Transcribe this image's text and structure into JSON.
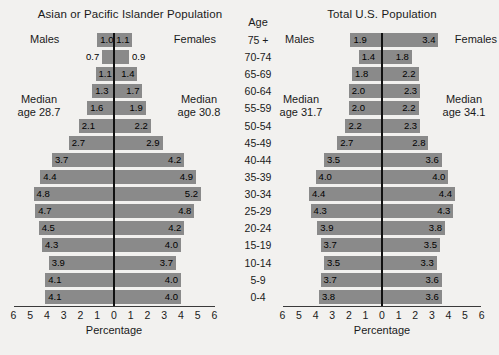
{
  "age_column": {
    "header": "Age",
    "groups": [
      "75 +",
      "70-74",
      "65-69",
      "60-64",
      "55-59",
      "50-54",
      "45-49",
      "40-44",
      "35-39",
      "30-34",
      "25-29",
      "20-24",
      "15-19",
      "10-14",
      "5-9",
      "0-4"
    ]
  },
  "axis": {
    "caption": "Percentage",
    "ticks": [
      "6",
      "5",
      "4",
      "3",
      "2",
      "1",
      "0",
      "1",
      "2",
      "3",
      "4",
      "5",
      "6"
    ],
    "max": 6
  },
  "panels": [
    {
      "id": "left",
      "title": "Asian or Pacific Islander Population",
      "males_label": "Males",
      "females_label": "Females",
      "median_male": "Median\nage 28.7",
      "median_male_line1": "Median",
      "median_male_line2": "age 28.7",
      "median_female_line1": "Median",
      "median_female_line2": "age 30.8"
    },
    {
      "id": "right",
      "title": "Total U.S. Population",
      "males_label": "Males",
      "females_label": "Females",
      "median_male_line1": "Median",
      "median_male_line2": "age 31.7",
      "median_female_line1": "Median",
      "median_female_line2": "age 34.1"
    }
  ],
  "colors": {
    "bar": "#8a8a8a",
    "background": "#f2f1ef",
    "axis": "#3a3a3a",
    "text": "#1a1a1a"
  },
  "chart_data": [
    {
      "type": "bar",
      "title": "Asian or Pacific Islander Population",
      "subtype": "population-pyramid",
      "xlabel": "Percentage",
      "ylabel": "Age",
      "xlim": [
        -6,
        6
      ],
      "xticks": [
        6,
        5,
        4,
        3,
        2,
        1,
        0,
        1,
        2,
        3,
        4,
        5,
        6
      ],
      "grid": false,
      "legend": [
        "Males",
        "Females"
      ],
      "annotations": [
        "Median age 28.7",
        "Median age 30.8"
      ],
      "categories": [
        "75 +",
        "70-74",
        "65-69",
        "60-64",
        "55-59",
        "50-54",
        "45-49",
        "40-44",
        "35-39",
        "30-34",
        "25-29",
        "20-24",
        "15-19",
        "10-14",
        "5-9",
        "0-4"
      ],
      "series": [
        {
          "name": "Males",
          "values": [
            1.0,
            0.7,
            1.1,
            1.3,
            1.6,
            2.1,
            2.7,
            3.7,
            4.4,
            4.8,
            4.7,
            4.5,
            4.3,
            3.9,
            4.1,
            4.1
          ]
        },
        {
          "name": "Females",
          "values": [
            1.1,
            0.9,
            1.4,
            1.7,
            1.9,
            2.2,
            2.9,
            4.2,
            4.9,
            5.2,
            4.8,
            4.2,
            4.0,
            3.7,
            4.0,
            4.0
          ]
        }
      ],
      "label_outside_rows": [
        1
      ]
    },
    {
      "type": "bar",
      "title": "Total U.S. Population",
      "subtype": "population-pyramid",
      "xlabel": "Percentage",
      "ylabel": "Age",
      "xlim": [
        -6,
        6
      ],
      "xticks": [
        6,
        5,
        4,
        3,
        2,
        1,
        0,
        1,
        2,
        3,
        4,
        5,
        6
      ],
      "grid": false,
      "legend": [
        "Males",
        "Females"
      ],
      "annotations": [
        "Median age 31.7",
        "Median age 34.1"
      ],
      "categories": [
        "75 +",
        "70-74",
        "65-69",
        "60-64",
        "55-59",
        "50-54",
        "45-49",
        "40-44",
        "35-39",
        "30-34",
        "25-29",
        "20-24",
        "15-19",
        "10-14",
        "5-9",
        "0-4"
      ],
      "series": [
        {
          "name": "Males",
          "values": [
            1.9,
            1.4,
            1.8,
            2.0,
            2.0,
            2.2,
            2.7,
            3.5,
            4.0,
            4.4,
            4.3,
            3.9,
            3.7,
            3.5,
            3.7,
            3.8
          ]
        },
        {
          "name": "Females",
          "values": [
            3.4,
            1.8,
            2.2,
            2.3,
            2.2,
            2.3,
            2.8,
            3.6,
            4.0,
            4.4,
            4.3,
            3.8,
            3.5,
            3.3,
            3.6,
            3.6
          ]
        }
      ],
      "label_outside_rows": []
    }
  ]
}
